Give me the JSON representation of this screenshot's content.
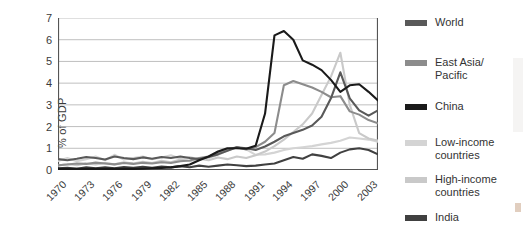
{
  "chart_data": {
    "type": "line",
    "title": "",
    "subtitle": "",
    "xlabel": "",
    "ylabel": "% of GDP",
    "xlim": [
      1970,
      2004
    ],
    "ylim": [
      0,
      7
    ],
    "yticks": [
      0,
      1,
      2,
      3,
      4,
      5,
      6,
      7
    ],
    "xticks": [
      1970,
      1973,
      1976,
      1979,
      1982,
      1985,
      1988,
      1991,
      1994,
      1997,
      2000,
      2003
    ],
    "xtick_labels": [
      "1970",
      "1973",
      "1976",
      "1979",
      "1982",
      "1985",
      "1988",
      "1991",
      "1994",
      "1997",
      "2000",
      "2003"
    ],
    "ytick_labels": [
      "0",
      "1",
      "2",
      "3",
      "4",
      "5",
      "6",
      "7"
    ],
    "grid": "horizontal",
    "legend_position": "right",
    "x": [
      1970,
      1971,
      1972,
      1973,
      1974,
      1975,
      1976,
      1977,
      1978,
      1979,
      1980,
      1981,
      1982,
      1983,
      1984,
      1985,
      1986,
      1987,
      1988,
      1989,
      1990,
      1991,
      1992,
      1993,
      1994,
      1995,
      1996,
      1997,
      1998,
      1999,
      2000,
      2001,
      2002,
      2003,
      2004
    ],
    "series": [
      {
        "name": "World",
        "color": "#595959",
        "values": [
          0.5,
          0.45,
          0.52,
          0.6,
          0.55,
          0.48,
          0.62,
          0.55,
          0.5,
          0.58,
          0.52,
          0.6,
          0.55,
          0.62,
          0.55,
          0.5,
          0.6,
          0.72,
          0.88,
          1.05,
          1.0,
          0.92,
          1.08,
          1.3,
          1.55,
          1.7,
          1.85,
          2.05,
          2.45,
          3.3,
          4.5,
          3.3,
          2.75,
          2.5,
          2.75
        ]
      },
      {
        "name": "East Asia/\nPacific",
        "color": "#8c8c8c",
        "values": [
          0.22,
          0.25,
          0.3,
          0.28,
          0.34,
          0.3,
          0.26,
          0.32,
          0.28,
          0.33,
          0.3,
          0.36,
          0.32,
          0.4,
          0.44,
          0.55,
          0.62,
          0.78,
          0.95,
          1.05,
          0.95,
          1.05,
          1.3,
          1.7,
          3.9,
          4.1,
          3.95,
          3.8,
          3.6,
          3.35,
          3.4,
          2.7,
          2.55,
          2.3,
          2.15
        ]
      },
      {
        "name": "China",
        "color": "#1a1a1a",
        "values": [
          0.05,
          0.05,
          0.05,
          0.05,
          0.05,
          0.05,
          0.05,
          0.05,
          0.05,
          0.06,
          0.08,
          0.1,
          0.12,
          0.18,
          0.25,
          0.45,
          0.62,
          0.85,
          1.0,
          1.0,
          0.98,
          1.12,
          2.6,
          6.2,
          6.4,
          6.0,
          5.05,
          4.85,
          4.6,
          4.15,
          3.6,
          3.9,
          3.95,
          3.6,
          3.2
        ]
      },
      {
        "name": "Low-income\ncountries",
        "color": "#d4d4d4",
        "values": [
          0.42,
          0.55,
          0.4,
          0.5,
          0.62,
          0.45,
          0.7,
          0.48,
          0.55,
          0.62,
          0.5,
          0.58,
          0.68,
          0.52,
          0.6,
          0.48,
          0.55,
          0.7,
          0.9,
          1.05,
          0.95,
          0.7,
          0.72,
          0.8,
          0.92,
          1.0,
          1.05,
          1.1,
          1.18,
          1.25,
          1.35,
          1.5,
          1.45,
          1.4,
          1.3
        ]
      },
      {
        "name": "High-income\ncountries",
        "color": "#c9c9c9",
        "values": [
          0.2,
          0.28,
          0.22,
          0.3,
          0.26,
          0.32,
          0.26,
          0.35,
          0.3,
          0.38,
          0.32,
          0.42,
          0.36,
          0.48,
          0.4,
          0.52,
          0.45,
          0.58,
          0.5,
          0.62,
          0.55,
          0.68,
          0.85,
          1.1,
          1.4,
          1.75,
          2.1,
          2.6,
          3.45,
          4.3,
          5.4,
          3.0,
          1.7,
          1.45,
          1.35
        ]
      },
      {
        "name": "India",
        "color": "#404040",
        "values": [
          0.08,
          0.1,
          0.06,
          0.12,
          0.08,
          0.12,
          0.08,
          0.14,
          0.1,
          0.15,
          0.1,
          0.16,
          0.12,
          0.18,
          0.13,
          0.2,
          0.15,
          0.2,
          0.25,
          0.22,
          0.18,
          0.2,
          0.25,
          0.3,
          0.45,
          0.6,
          0.52,
          0.72,
          0.65,
          0.55,
          0.8,
          0.95,
          1.0,
          0.92,
          0.72
        ]
      }
    ]
  },
  "legend": {
    "items": [
      {
        "label": "World",
        "color": "#595959"
      },
      {
        "label": "East Asia/\nPacific",
        "color": "#8c8c8c"
      },
      {
        "label": "China",
        "color": "#1a1a1a"
      },
      {
        "label": "Low-income\ncountries",
        "color": "#d4d4d4"
      },
      {
        "label": "High-income\ncountries",
        "color": "#c9c9c9"
      },
      {
        "label": "India",
        "color": "#404040"
      }
    ]
  },
  "style": {
    "background": "#ffffff",
    "axis_color": "#555555",
    "grid_color": "#b8b8b8",
    "text_color": "#333333"
  }
}
